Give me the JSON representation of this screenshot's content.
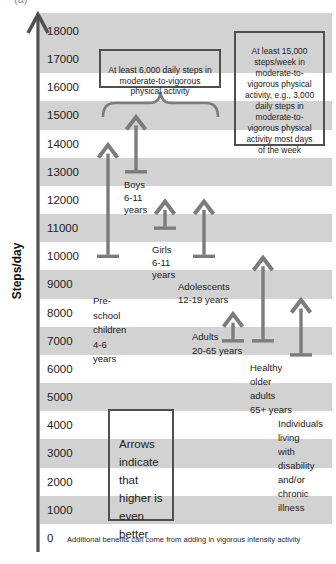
{
  "figure_label": "(a)",
  "chart_data": {
    "type": "bar",
    "subtype": "vertical-range-arrows",
    "ylabel": "Steps/day",
    "ylim": [
      0,
      18500
    ],
    "yticks": [
      0,
      1000,
      2000,
      3000,
      4000,
      5000,
      6000,
      7000,
      8000,
      9000,
      10000,
      11000,
      12000,
      13000,
      14000,
      15000,
      16000,
      17000,
      18000
    ],
    "grid": "alternating horizontal shaded bands (odd thousands gray)",
    "legend": "none",
    "arrows_open_ended": true,
    "groups": [
      {
        "id": "preschool",
        "name": "Pre-school children 4-6 years",
        "range": [
          10000,
          14000
        ],
        "label_lines": [
          "Pre-",
          "school",
          "children",
          "4-6",
          "years"
        ],
        "x": 108,
        "label_x": 93,
        "label_y": 294,
        "lh": 14.5
      },
      {
        "id": "boys",
        "name": "Boys 6-11 years",
        "range": [
          13000,
          15000
        ],
        "label_lines": [
          "Boys",
          "6-11",
          "years"
        ],
        "x": 136,
        "label_x": 124,
        "label_y": 179,
        "lh": 12.5
      },
      {
        "id": "girls",
        "name": "Girls 6-11 years",
        "range": [
          11000,
          12000
        ],
        "label_lines": [
          "Girls",
          "6-11",
          "years"
        ],
        "x": 165,
        "label_x": 152,
        "label_y": 244,
        "lh": 12.5
      },
      {
        "id": "adolescents",
        "name": "Adolescents 12-19 years",
        "range": [
          10000,
          12000
        ],
        "label_lines": [
          "Adolescents",
          "12-19 years"
        ],
        "x": 204,
        "label_x": 178,
        "label_y": 280,
        "lh": 13
      },
      {
        "id": "adults",
        "name": "Adults 20-65 years",
        "range": [
          7000,
          8000
        ],
        "label_lines": [
          "Adults",
          "20-65 years"
        ],
        "x": 233,
        "label_x": 192,
        "label_y": 330,
        "lh": 14
      },
      {
        "id": "older-adults",
        "name": "Healthy older adults 65+ years",
        "range": [
          7000,
          10000
        ],
        "label_lines": [
          "Healthy",
          "older",
          "adults",
          "65+ years"
        ],
        "x": 263,
        "label_x": 250,
        "label_y": 361,
        "lh": 14
      },
      {
        "id": "disability",
        "name": "Individuals living with disability and/or chronic illness",
        "range": [
          6500,
          8500
        ],
        "label_lines": [
          "Individuals",
          "living",
          "with",
          "disability",
          "and/or",
          "chronic",
          "illness"
        ],
        "x": 301,
        "label_x": 278,
        "label_y": 417,
        "lh": 14
      }
    ],
    "annotations": {
      "children_box": "At least 6,000 daily steps in\nmoderate-to-vigorous\nphysical activity",
      "weekly_box": "At least 15,000\nsteps/week in\nmoderate-to-\nvigorous physical\nactivity, e.g., 3,000\ndaily steps in\nmoderate-to-\nvigorous physical\nactivity most days\nof the week",
      "arrows_note_box": "Arrows\nindicate\nthat\nhigher is\neven\nbetter",
      "footnote": "Additional benefits can come from adding in vigorous intensity activity"
    },
    "colors": {
      "band_gray": "#d2d2d2",
      "arrow_gray": "#7c7c7c",
      "axis": "#4f4f4f",
      "box_border": "#4f4f4f",
      "text": "#1d1d1d"
    },
    "layout": {
      "plot_left": 40,
      "plot_right": 332,
      "plot_top": 13,
      "plot_bottom": 552,
      "axis_x": 38,
      "y_zero_px": 538,
      "px_per_1000": 28.17,
      "tick_label_x": 47
    }
  }
}
